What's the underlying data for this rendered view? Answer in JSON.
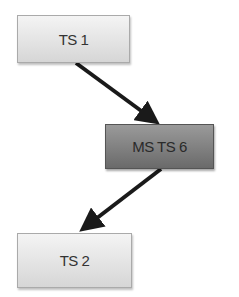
{
  "diagram": {
    "nodes": [
      {
        "id": "ts1",
        "label": "TS 1",
        "style": "light"
      },
      {
        "id": "msts6",
        "label": "MS TS 6",
        "style": "dark"
      },
      {
        "id": "ts2",
        "label": "TS 2",
        "style": "light"
      }
    ],
    "edges": [
      {
        "from": "ts1",
        "to": "msts6"
      },
      {
        "from": "msts6",
        "to": "ts2"
      }
    ],
    "colors": {
      "light_fill": "#e4e4e4",
      "dark_fill": "#7f7f7f",
      "arrow": "#1a1a1a"
    }
  }
}
